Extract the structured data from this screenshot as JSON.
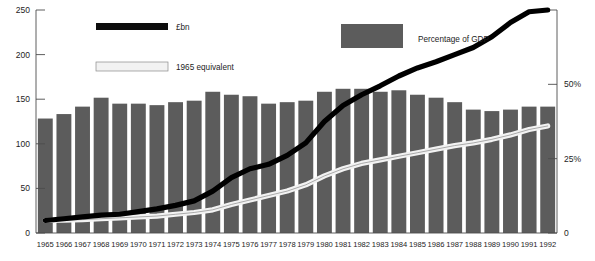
{
  "chart_data": {
    "type": "bar",
    "title": "",
    "subtitle": "",
    "xlabel": "",
    "ylabel": "",
    "y2label": "",
    "categories": [
      "1965",
      "1966",
      "1967",
      "1968",
      "1969",
      "1970",
      "1971",
      "1972",
      "1973",
      "1974",
      "1975",
      "1976",
      "1977",
      "1978",
      "1979",
      "1980",
      "1981",
      "1982",
      "1983",
      "1984",
      "1985",
      "1986",
      "1987",
      "1988",
      "1989",
      "1990",
      "1991",
      "1992"
    ],
    "ylim": [
      0,
      250
    ],
    "yticks": [
      0,
      50,
      100,
      150,
      200,
      250
    ],
    "ytick_labels": [
      "0",
      "50",
      "100",
      "150",
      "200",
      "250"
    ],
    "y2lim": [
      0,
      75
    ],
    "y2ticks": [
      0,
      25,
      50
    ],
    "y2tick_labels": [
      "0",
      "25%",
      "50%"
    ],
    "grid": false,
    "legend_position": "top",
    "series": [
      {
        "name": "Percentage of GDP",
        "kind": "bar",
        "axis": "right",
        "unit": "%",
        "color": "#5c5c5c",
        "values": [
          38.5,
          40.0,
          42.5,
          45.5,
          43.5,
          43.5,
          43.0,
          44.0,
          44.5,
          47.5,
          46.5,
          46.0,
          43.5,
          44.0,
          44.5,
          47.5,
          48.5,
          48.5,
          47.5,
          48.0,
          46.5,
          45.5,
          44.0,
          41.5,
          41.0,
          41.5,
          42.5,
          42.5
        ]
      },
      {
        "name": "£bn",
        "kind": "line",
        "axis": "left",
        "unit": "£bn",
        "color": "#000000",
        "values": [
          14,
          16,
          18,
          20,
          21,
          24,
          27,
          31,
          36,
          47,
          62,
          72,
          77,
          87,
          101,
          125,
          143,
          155,
          165,
          176,
          185,
          192,
          200,
          208,
          220,
          236,
          248,
          250
        ]
      },
      {
        "name": "1965 equivalent",
        "kind": "line",
        "axis": "left",
        "unit": "£bn",
        "color": "#f2f2f2",
        "values": [
          14,
          14.5,
          15,
          16,
          17,
          18,
          19,
          21,
          23,
          26,
          32,
          37,
          42,
          47,
          54,
          64,
          72,
          78,
          82,
          86,
          90,
          94,
          98,
          101,
          105,
          110,
          116,
          120
        ]
      }
    ],
    "legend": [
      {
        "label": "£bn",
        "swatch": "black-bar",
        "color": "#0d0d0d"
      },
      {
        "label": "1965 equivalent",
        "swatch": "white-bar",
        "color": "#f2f2f2"
      },
      {
        "label": "Percentage of GDP",
        "swatch": "gray-bar",
        "color": "#5c5c5c"
      }
    ]
  },
  "colors": {
    "bar": "#5c5c5c",
    "line_black": "#000000",
    "line_white": "#f2f2f2",
    "axis": "#4d4d4d",
    "background": "#ffffff"
  }
}
